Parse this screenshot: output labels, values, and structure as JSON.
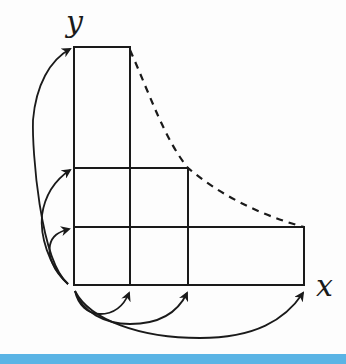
{
  "diagram": {
    "axes": {
      "x_label": "x",
      "y_label": "y"
    },
    "colors": {
      "line": "#1a1a1a",
      "background": "#fdfdfd",
      "bottom_bar": "#5ab4e5"
    },
    "grid": {
      "origin": [
        74,
        285
      ],
      "vertical_lines_x": [
        74,
        130,
        188,
        304
      ],
      "horizontal_lines_y": [
        47,
        168,
        227,
        285
      ]
    },
    "regions": [
      {
        "name": "tall-column",
        "x": [
          74,
          130
        ],
        "y": [
          47,
          285
        ]
      },
      {
        "name": "middle-square-block",
        "x": [
          74,
          188
        ],
        "y": [
          168,
          285
        ]
      },
      {
        "name": "wide-row",
        "x": [
          74,
          304
        ],
        "y": [
          227,
          285
        ]
      }
    ],
    "dashed_curve": {
      "points": [
        [
          130,
          47
        ],
        [
          188,
          168
        ],
        [
          304,
          227
        ]
      ],
      "style": "dashed",
      "meaning": "hyperbola-like boundary"
    },
    "arrows_left": [
      {
        "from": [
          72,
          285
        ],
        "to": [
          72,
          227
        ]
      },
      {
        "from": [
          72,
          285
        ],
        "to": [
          72,
          168
        ]
      },
      {
        "from": [
          72,
          285
        ],
        "to": [
          72,
          47
        ]
      }
    ],
    "arrows_bottom": [
      {
        "from": [
          74,
          287
        ],
        "to": [
          130,
          287
        ]
      },
      {
        "from": [
          74,
          287
        ],
        "to": [
          188,
          287
        ]
      },
      {
        "from": [
          74,
          287
        ],
        "to": [
          304,
          287
        ]
      }
    ]
  }
}
